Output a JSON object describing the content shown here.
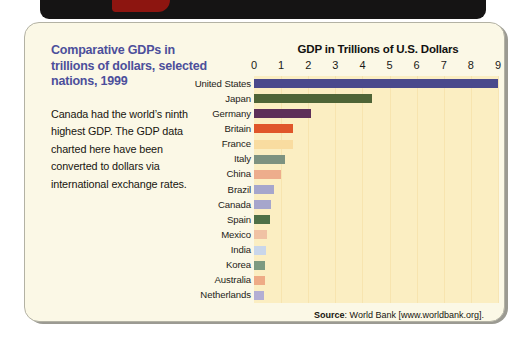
{
  "card": {
    "heading": "Comparative GDPs in trillions of dollars, selected nations, 1999",
    "description": "Canada had the world’s ninth highest GDP. The GDP data charted here have been converted to dollars via international exchange rates.",
    "source_prefix": "Source",
    "source_text": ": World Bank [www.worldbank.org].",
    "heading_color": "#4c4f9b",
    "plot_background": "#fbeec2",
    "card_background": "#fbf8e6"
  },
  "chart_data": {
    "type": "bar",
    "orientation": "horizontal",
    "title": "GDP in Trillions of U.S. Dollars",
    "xlabel": "",
    "ylabel": "",
    "xlim": [
      0,
      9
    ],
    "xticks": [
      0,
      1,
      2,
      3,
      4,
      5,
      6,
      7,
      8,
      9
    ],
    "grid": true,
    "legend": false,
    "units": "trillions of U.S. dollars",
    "year": 1999,
    "categories": [
      "United States",
      "Japan",
      "Germany",
      "Britain",
      "France",
      "Italy",
      "China",
      "Brazil",
      "Canada",
      "Spain",
      "Mexico",
      "India",
      "Korea",
      "Australia",
      "Netherlands"
    ],
    "values": [
      9.0,
      4.35,
      2.1,
      1.45,
      1.43,
      1.15,
      1.0,
      0.75,
      0.63,
      0.58,
      0.48,
      0.45,
      0.41,
      0.39,
      0.38
    ],
    "colors": [
      "#49498c",
      "#4e6436",
      "#5d2f59",
      "#e0562a",
      "#f9dca0",
      "#7d9280",
      "#edad8c",
      "#a6a6cc",
      "#a6a6cc",
      "#4e7047",
      "#f0c2a4",
      "#c9d6ea",
      "#7d9a80",
      "#eeab86",
      "#b3aed4"
    ]
  }
}
